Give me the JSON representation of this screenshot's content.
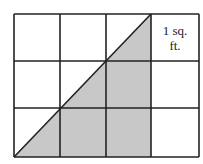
{
  "diagram": {
    "grid": {
      "columns": 4,
      "rows": 3,
      "x0": 14,
      "y0": 14,
      "x1": 199,
      "y1": 157,
      "col_lines": [
        14,
        60,
        106,
        151,
        199
      ],
      "row_lines": [
        14,
        61,
        108,
        157
      ]
    },
    "shaded_triangle": {
      "points": "14,157 151,14 151,157",
      "fill": "#c8c8c8"
    },
    "diagonal": {
      "x1": 14,
      "y1": 157,
      "x2": 151,
      "y2": 14
    },
    "label": {
      "line1": "1 sq.",
      "line2": "ft."
    },
    "colors": {
      "line": "#222222",
      "shade": "#c8c8c8",
      "background": "#ffffff"
    }
  }
}
